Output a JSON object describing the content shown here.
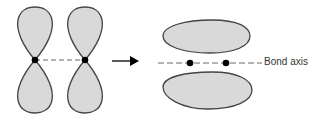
{
  "diagram": {
    "left_panel": {
      "description": "Two parallel p orbitals (dumbbell lobes) with nuclei on dashed axis"
    },
    "arrow": {
      "direction": "right"
    },
    "right_panel": {
      "description": "Pi bond electron density above and below bond axis"
    },
    "labels": {
      "bond_axis": "Bond axis"
    },
    "colors": {
      "lobe_fill": "#d9d9d9",
      "lobe_stroke": "#444444",
      "nucleus": "#000000"
    }
  }
}
